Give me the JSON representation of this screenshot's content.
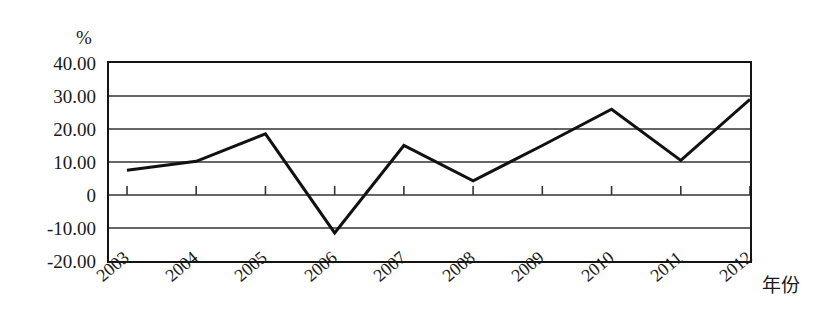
{
  "chart_data": {
    "type": "line",
    "title": "",
    "subtitle": "",
    "xlabel": "年份",
    "ylabel": "%",
    "unit_label": "%",
    "categories": [
      "2003",
      "2004",
      "2005",
      "2006",
      "2007",
      "2008",
      "2009",
      "2010",
      "2011",
      "2012"
    ],
    "values": [
      7.5,
      10.2,
      18.5,
      -11.5,
      15.0,
      4.3,
      15.0,
      26.0,
      10.5,
      29.0
    ],
    "series": [
      {
        "name": "",
        "values": [
          7.5,
          10.2,
          18.5,
          -11.5,
          15.0,
          4.3,
          15.0,
          26.0,
          10.5,
          29.0
        ]
      }
    ],
    "ylim": [
      -20,
      40
    ],
    "xlim": [
      2003,
      2012
    ],
    "y_ticks": [
      40,
      30,
      20,
      10,
      0,
      -10,
      -20
    ],
    "y_tick_labels": [
      "40.00",
      "30.00",
      "20.00",
      "10.00",
      "0",
      "-10.00",
      "-20.00"
    ],
    "x_tick_labels": [
      "2003",
      "2004",
      "2005",
      "2006",
      "2007",
      "2008",
      "2009",
      "2010",
      "2011",
      "2012"
    ],
    "grid": true,
    "grid_axis": "y",
    "legend": false,
    "legend_position": "none",
    "line_color": "#111111",
    "line_width": 3,
    "grid_color": "#333333",
    "border_color": "#141414",
    "markers": false,
    "annotations": []
  },
  "axis": {
    "y_title": "%",
    "x_title": "年份"
  }
}
